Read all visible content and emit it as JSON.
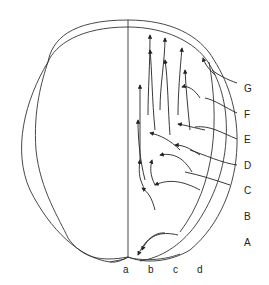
{
  "diagram": {
    "type": "embryo-cell-migration-map",
    "row_labels": [
      "G",
      "F",
      "E",
      "D",
      "C",
      "B",
      "A"
    ],
    "column_labels": [
      "a",
      "b",
      "c",
      "d"
    ],
    "colors": {
      "line": "#333333",
      "background": "#ffffff"
    }
  }
}
